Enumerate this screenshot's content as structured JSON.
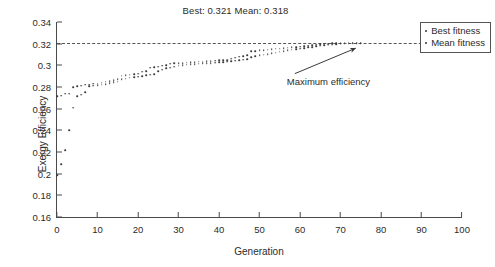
{
  "chart_data": {
    "type": "scatter",
    "title": "Best: 0.321 Mean: 0.318",
    "xlabel": "Generation",
    "ylabel": "Exergy Efficiency",
    "xlim": [
      0,
      100
    ],
    "ylim": [
      0.16,
      0.34
    ],
    "xticks": [
      0,
      10,
      20,
      30,
      40,
      50,
      60,
      70,
      80,
      90,
      100
    ],
    "yticks": [
      0.16,
      0.18,
      0.2,
      0.22,
      0.24,
      0.26,
      0.28,
      0.3,
      0.32,
      0.34
    ],
    "ytick_labels": [
      "0.16",
      "0.18",
      "0.2",
      "0.22",
      "0.24",
      "0.26",
      "0.28",
      "0.3",
      "0.32",
      "0.34"
    ],
    "grid": false,
    "legend_position": "top-right",
    "legend": [
      "Best fitness",
      "Mean fitness"
    ],
    "reference_line": {
      "label": "",
      "y": 0.321,
      "style": "dashed"
    },
    "annotations": [
      {
        "text": "Maximum efficiency",
        "x": 57,
        "y": 0.2905,
        "arrow_to_x": 74,
        "arrow_to_y": 0.3195
      }
    ],
    "series": [
      {
        "name": "Best fitness",
        "x": [
          0,
          1,
          2,
          3,
          4,
          5,
          6,
          7,
          8,
          9,
          10,
          11,
          12,
          13,
          14,
          15,
          16,
          17,
          18,
          19,
          20,
          21,
          22,
          23,
          24,
          25,
          26,
          27,
          28,
          29,
          30,
          31,
          32,
          33,
          34,
          35,
          36,
          37,
          38,
          39,
          40,
          41,
          42,
          43,
          44,
          45,
          46,
          47,
          48,
          49,
          50,
          51,
          52,
          53,
          54,
          55,
          56,
          57,
          58,
          59,
          60,
          61,
          62,
          63,
          64,
          65,
          66,
          67,
          68,
          69,
          70,
          71,
          72,
          73,
          74,
          75
        ],
        "values": [
          0.2715,
          0.272,
          0.2738,
          0.274,
          0.28,
          0.2805,
          0.2812,
          0.282,
          0.2822,
          0.283,
          0.2832,
          0.284,
          0.2848,
          0.2855,
          0.2862,
          0.287,
          0.2905,
          0.2908,
          0.2912,
          0.2918,
          0.2922,
          0.2942,
          0.2948,
          0.2978,
          0.2982,
          0.2988,
          0.2995,
          0.3002,
          0.3015,
          0.3018,
          0.302,
          0.3022,
          0.3025,
          0.3028,
          0.303,
          0.3032,
          0.3035,
          0.3038,
          0.304,
          0.3042,
          0.3045,
          0.3048,
          0.305,
          0.306,
          0.3072,
          0.308,
          0.3085,
          0.3092,
          0.313,
          0.3132,
          0.3138,
          0.3142,
          0.3145,
          0.3148,
          0.3152,
          0.3155,
          0.3158,
          0.3162,
          0.3165,
          0.3168,
          0.3172,
          0.3178,
          0.3182,
          0.3188,
          0.3192,
          0.3195,
          0.3198,
          0.32,
          0.3202,
          0.3205,
          0.3206,
          0.3208,
          0.3208,
          0.321,
          0.321,
          0.321
        ]
      },
      {
        "name": "Mean fitness",
        "x": [
          0,
          1,
          2,
          3,
          4,
          5,
          6,
          7,
          8,
          9,
          10,
          11,
          12,
          13,
          14,
          15,
          16,
          17,
          18,
          19,
          20,
          21,
          22,
          23,
          24,
          25,
          26,
          27,
          28,
          29,
          30,
          31,
          32,
          33,
          34,
          35,
          36,
          37,
          38,
          39,
          40,
          41,
          42,
          43,
          44,
          45,
          46,
          47,
          48,
          49,
          50,
          51,
          52,
          53,
          54,
          55,
          56,
          57,
          58,
          59,
          60,
          61,
          62,
          63,
          64,
          65,
          66,
          67,
          68,
          69,
          70,
          71,
          72,
          73,
          74,
          75
        ],
        "values": [
          0.1985,
          0.209,
          0.2215,
          0.24,
          0.261,
          0.2715,
          0.273,
          0.2752,
          0.2805,
          0.2812,
          0.2818,
          0.2822,
          0.2828,
          0.2835,
          0.2842,
          0.285,
          0.287,
          0.2878,
          0.2885,
          0.289,
          0.2895,
          0.29,
          0.2908,
          0.2915,
          0.292,
          0.2948,
          0.2958,
          0.2972,
          0.298,
          0.2988,
          0.2995,
          0.3,
          0.3005,
          0.3008,
          0.3012,
          0.3015,
          0.3018,
          0.302,
          0.3022,
          0.3025,
          0.3028,
          0.303,
          0.3035,
          0.3038,
          0.3042,
          0.3048,
          0.3052,
          0.3058,
          0.3075,
          0.3085,
          0.3092,
          0.3098,
          0.3105,
          0.311,
          0.3118,
          0.3125,
          0.313,
          0.3138,
          0.3145,
          0.315,
          0.3155,
          0.316,
          0.3165,
          0.317,
          0.3175,
          0.318,
          0.3185,
          0.319,
          0.3192,
          0.3195,
          0.3198,
          0.32,
          0.32,
          0.3202,
          0.3202,
          0.3202
        ]
      }
    ]
  }
}
